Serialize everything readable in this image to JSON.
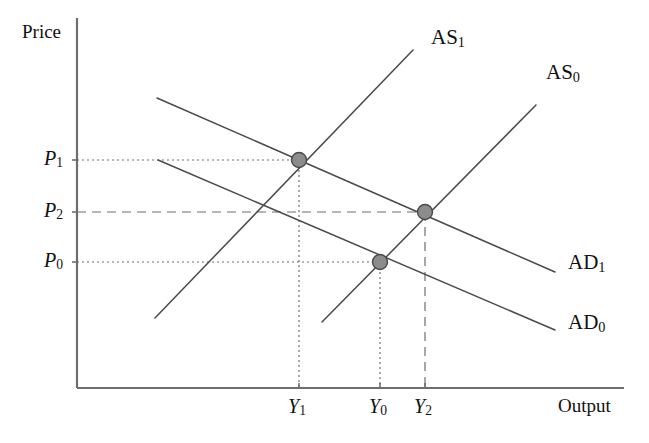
{
  "figure": {
    "type": "economics-as-ad-diagram",
    "background": "#ffffff",
    "width": 649,
    "height": 443
  },
  "axes": {
    "y_label": "Price",
    "x_label": "Output",
    "color": "#6e6e6e",
    "origin": {
      "x": 77,
      "y": 388
    },
    "y_top": {
      "x": 77,
      "y": 18
    },
    "x_right": {
      "x": 624,
      "y": 388
    }
  },
  "y_ticks": [
    {
      "name": "P1",
      "label": "P",
      "subscript": "1",
      "y": 160,
      "label_x": 44,
      "label_y": 148
    },
    {
      "name": "P2",
      "label": "P",
      "subscript": "2",
      "y": 212,
      "label_x": 44,
      "label_y": 200
    },
    {
      "name": "P0",
      "label": "P",
      "subscript": "0",
      "y": 262,
      "label_x": 44,
      "label_y": 250
    }
  ],
  "x_ticks": [
    {
      "name": "Y1",
      "label": "Y",
      "subscript": "1",
      "x": 299,
      "label_x": 288,
      "label_y": 396
    },
    {
      "name": "Y0",
      "label": "Y",
      "subscript": "0",
      "x": 380,
      "label_x": 369,
      "label_y": 396
    },
    {
      "name": "Y2",
      "label": "Y",
      "subscript": "2",
      "x": 425,
      "label_x": 414,
      "label_y": 396
    }
  ],
  "curves": [
    {
      "name": "AS1",
      "label": "AS",
      "subscript": "1",
      "kind": "aggregate-supply",
      "x1": 155,
      "y1": 318,
      "x2": 413,
      "y2": 50,
      "label_x": 431,
      "label_y": 27,
      "color": "#4a4a4a"
    },
    {
      "name": "AS0",
      "label": "AS",
      "subscript": "0",
      "kind": "aggregate-supply",
      "x1": 322,
      "y1": 322,
      "x2": 536,
      "y2": 105,
      "label_x": 546,
      "label_y": 62,
      "color": "#4a4a4a"
    },
    {
      "name": "AD1",
      "label": "AD",
      "subscript": "1",
      "kind": "aggregate-demand",
      "x1": 157,
      "y1": 98,
      "x2": 555,
      "y2": 272,
      "label_x": 568,
      "label_y": 252,
      "color": "#4a4a4a"
    },
    {
      "name": "AD0",
      "label": "AD",
      "subscript": "0",
      "kind": "aggregate-demand",
      "x1": 158,
      "y1": 160,
      "x2": 555,
      "y2": 330,
      "label_x": 568,
      "label_y": 312,
      "color": "#4a4a4a"
    }
  ],
  "equilibria": [
    {
      "name": "equilibrium-P1-Y1",
      "x": 299,
      "y": 160,
      "price": "P1",
      "output": "Y1",
      "r": 7.5,
      "fill": "#8c8c8c",
      "stroke": "#4a4a4a"
    },
    {
      "name": "equilibrium-P2-Y2",
      "x": 425,
      "y": 212,
      "price": "P2",
      "output": "Y2",
      "r": 7.5,
      "fill": "#8c8c8c",
      "stroke": "#4a4a4a"
    },
    {
      "name": "equilibrium-P0-Y0",
      "x": 380,
      "y": 262,
      "price": "P0",
      "output": "Y0",
      "r": 7.5,
      "fill": "#8c8c8c",
      "stroke": "#4a4a4a"
    }
  ],
  "guides": [
    {
      "name": "guide-h-P1",
      "orient": "horizontal",
      "from_x": 77,
      "to_x": 299,
      "y": 160,
      "style": "dotted",
      "color": "#6e6e6e"
    },
    {
      "name": "guide-h-P2",
      "orient": "horizontal",
      "from_x": 77,
      "to_x": 425,
      "y": 212,
      "style": "dashed",
      "color": "#6e6e6e"
    },
    {
      "name": "guide-h-P0",
      "orient": "horizontal",
      "from_x": 77,
      "to_x": 380,
      "y": 262,
      "style": "dotted",
      "color": "#6e6e6e"
    },
    {
      "name": "guide-v-Y1",
      "orient": "vertical",
      "x": 299,
      "from_y": 160,
      "to_y": 388,
      "style": "dotted",
      "color": "#6e6e6e"
    },
    {
      "name": "guide-v-Y0",
      "orient": "vertical",
      "x": 380,
      "from_y": 262,
      "to_y": 388,
      "style": "dotted",
      "color": "#6e6e6e"
    },
    {
      "name": "guide-v-Y2",
      "orient": "vertical",
      "x": 425,
      "from_y": 212,
      "to_y": 388,
      "style": "dashed",
      "color": "#6e6e6e"
    }
  ],
  "chart_data": {
    "type": "line",
    "title": "",
    "xlabel": "Output",
    "ylabel": "Price",
    "grid": false,
    "legend": "inline-curve-labels",
    "series": [
      {
        "name": "AS1",
        "points": [
          [
            155,
            318
          ],
          [
            413,
            50
          ]
        ],
        "slope": "upward",
        "note": "shifted aggregate supply"
      },
      {
        "name": "AS0",
        "points": [
          [
            322,
            322
          ],
          [
            536,
            105
          ]
        ],
        "slope": "upward",
        "note": "initial aggregate supply"
      },
      {
        "name": "AD1",
        "points": [
          [
            157,
            98
          ],
          [
            555,
            272
          ]
        ],
        "slope": "downward",
        "note": "shifted aggregate demand"
      },
      {
        "name": "AD0",
        "points": [
          [
            158,
            160
          ],
          [
            555,
            330
          ]
        ],
        "slope": "downward",
        "note": "initial aggregate demand"
      }
    ],
    "annotations": [
      {
        "label": "P1 / Y1",
        "intersection_of": [
          "AS1",
          "AD1"
        ]
      },
      {
        "label": "P2 / Y2",
        "intersection_of": [
          "AS0",
          "AD1"
        ]
      },
      {
        "label": "P0 / Y0",
        "intersection_of": [
          "AS1",
          "AD0"
        ]
      }
    ],
    "x_tick_labels": [
      "Y1",
      "Y0",
      "Y2"
    ],
    "y_tick_labels": [
      "P1",
      "P2",
      "P0"
    ]
  }
}
